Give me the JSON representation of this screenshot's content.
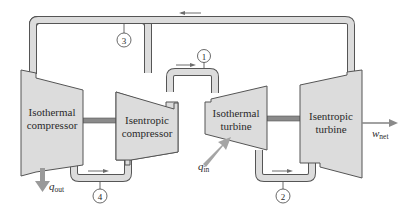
{
  "diagram": {
    "type": "gas power cycle schematic (Ericsson-type: isothermal/isentropic compression and expansion)",
    "components": [
      {
        "id": "iso_comp",
        "label_line1": "Isothermal",
        "label_line2": "compressor"
      },
      {
        "id": "isen_comp",
        "label_line1": "Isentropic",
        "label_line2": "compressor"
      },
      {
        "id": "iso_turb",
        "label_line1": "Isothermal",
        "label_line2": "turbine"
      },
      {
        "id": "isen_turb",
        "label_line1": "Isentropic",
        "label_line2": "turbine"
      }
    ],
    "states": [
      {
        "id": "1",
        "label": "1"
      },
      {
        "id": "2",
        "label": "2"
      },
      {
        "id": "3",
        "label": "3"
      },
      {
        "id": "4",
        "label": "4"
      }
    ],
    "energy_flows": {
      "q_out": {
        "symbol": "q",
        "subscript": "out"
      },
      "q_in": {
        "symbol": "q",
        "subscript": "in"
      },
      "w_net": {
        "symbol": "w",
        "subscript": "net"
      }
    },
    "colors": {
      "machine_fill": "#dcdcdc",
      "outline": "#555555",
      "shaft": "#8a8a8a",
      "heat_arrow": "#9a9a9a",
      "flow_arrow": "#6d6d6d"
    }
  }
}
